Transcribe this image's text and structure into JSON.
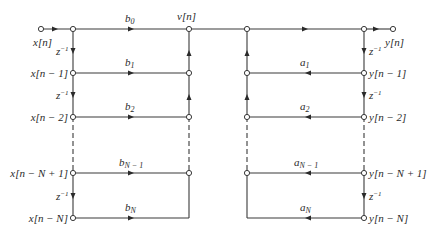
{
  "diagram": {
    "left_section": {
      "input_label": "x[n]",
      "intermediate_label": "v[n]",
      "delay_label": "z",
      "delay_exp": "−1",
      "taps": [
        {
          "node": "x[n]",
          "coef": "b",
          "sub": "0"
        },
        {
          "node": "x[n − 1]",
          "coef": "b",
          "sub": "1"
        },
        {
          "node": "x[n − 2]",
          "coef": "b",
          "sub": "2"
        },
        {
          "node": "x[n − N + 1]",
          "coef": "b",
          "sub": "N − 1"
        },
        {
          "node": "x[n − N]",
          "coef": "b",
          "sub": "N"
        }
      ]
    },
    "right_section": {
      "output_label": "y[n]",
      "delay_label": "z",
      "delay_exp": "−1",
      "taps": [
        {
          "node": "y[n − 1]",
          "coef": "a",
          "sub": "1"
        },
        {
          "node": "y[n − 2]",
          "coef": "a",
          "sub": "2"
        },
        {
          "node": "y[n − N + 1]",
          "coef": "a",
          "sub": "N − 1"
        },
        {
          "node": "y[n − N]",
          "coef": "a",
          "sub": "N"
        }
      ]
    },
    "colors": {
      "line": "#3a3a3a",
      "background": "#ffffff"
    }
  }
}
